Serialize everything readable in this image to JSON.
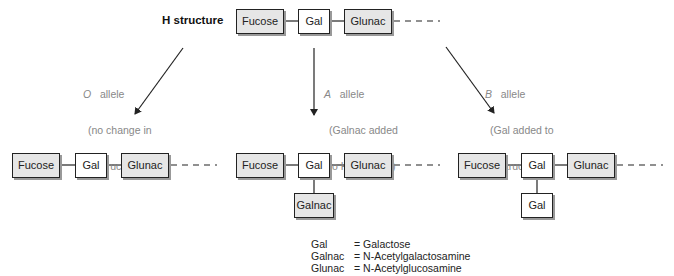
{
  "top": {
    "label": "H structure",
    "chain": [
      "Fucose",
      "Gal",
      "Glunac"
    ]
  },
  "alleles": [
    {
      "name": "O",
      "suffix": "allele",
      "desc_line1": "(no change in",
      "desc_line2": "H structure)"
    },
    {
      "name": "A",
      "suffix": "allele",
      "desc_line1": "(Galnac added",
      "desc_line2": "to H structure)"
    },
    {
      "name": "B",
      "suffix": "allele",
      "desc_line1": "(Gal added to",
      "desc_line2": "H structure)"
    }
  ],
  "results": [
    {
      "chain": [
        "Fucose",
        "Gal",
        "Glunac"
      ],
      "branch": null
    },
    {
      "chain": [
        "Fucose",
        "Gal",
        "Glunac"
      ],
      "branch": "Galnac"
    },
    {
      "chain": [
        "Fucose",
        "Gal",
        "Glunac"
      ],
      "branch": "Gal"
    }
  ],
  "legend": [
    {
      "abbr": "Gal",
      "eq": "= Galactose"
    },
    {
      "abbr": "Galnac",
      "eq": "= N-Acetylgalactosamine"
    },
    {
      "abbr": "Glunac",
      "eq": "= N-Acetylglucosamine"
    }
  ],
  "colors": {
    "shaded_box": "#e6e6e6",
    "border": "#222222",
    "note_text": "#888888"
  }
}
